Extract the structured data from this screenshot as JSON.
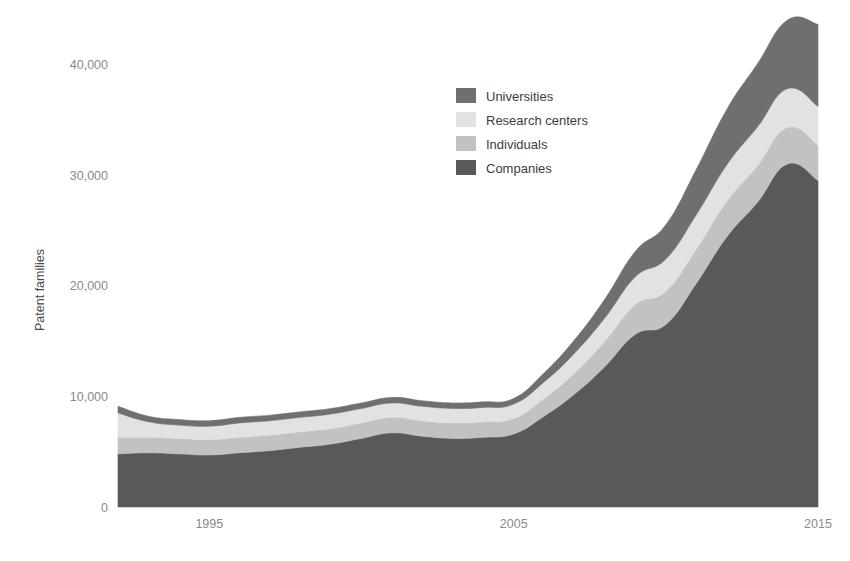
{
  "chart_data": {
    "type": "area",
    "stacked": true,
    "title": "",
    "xlabel": "",
    "ylabel": "Patent families",
    "xlim": [
      1992,
      2015
    ],
    "ylim": [
      0,
      44000
    ],
    "grid": false,
    "legend_position": "inside-upper-center",
    "y_ticks": [
      0,
      10000,
      20000,
      30000,
      40000
    ],
    "y_tick_labels": [
      "0",
      "10,000",
      "20,000",
      "30,000",
      "40,000"
    ],
    "x_ticks": [
      1995,
      2005,
      2015
    ],
    "x_tick_labels": [
      "1995",
      "2005",
      "2015"
    ],
    "x": [
      1992,
      1993,
      1994,
      1995,
      1996,
      1997,
      1998,
      1999,
      2000,
      2001,
      2002,
      2003,
      2004,
      2005,
      2006,
      2007,
      2008,
      2009,
      2010,
      2011,
      2012,
      2013,
      2014,
      2015
    ],
    "series": [
      {
        "name": "Companies",
        "color": "#595959",
        "stack_order": 1,
        "values": [
          4800,
          4900,
          4800,
          4700,
          4900,
          5100,
          5400,
          5700,
          6200,
          6700,
          6400,
          6200,
          6300,
          6600,
          8200,
          10200,
          12700,
          15600,
          16500,
          20200,
          24400,
          27500,
          31000,
          29500
        ]
      },
      {
        "name": "Individuals",
        "color": "#c2c2c2",
        "stack_order": 2,
        "values": [
          1500,
          1400,
          1400,
          1400,
          1400,
          1400,
          1400,
          1400,
          1400,
          1400,
          1400,
          1400,
          1400,
          1400,
          1600,
          1900,
          2300,
          2700,
          3000,
          3100,
          3200,
          3300,
          3300,
          3200
        ]
      },
      {
        "name": "Research centers",
        "color": "#e2e2e2",
        "stack_order": 3,
        "values": [
          2200,
          1400,
          1200,
          1200,
          1300,
          1300,
          1300,
          1300,
          1300,
          1300,
          1300,
          1300,
          1300,
          1300,
          1500,
          1800,
          2100,
          2500,
          2900,
          3100,
          3300,
          3500,
          3500,
          3500
        ]
      },
      {
        "name": "Universities",
        "color": "#6f6f6f",
        "stack_order": 4,
        "values": [
          600,
          500,
          500,
          500,
          500,
          500,
          500,
          500,
          500,
          500,
          500,
          500,
          500,
          500,
          800,
          1200,
          1700,
          2300,
          3100,
          4100,
          5000,
          5700,
          6200,
          7400
        ]
      }
    ],
    "totals": [
      9100,
      8200,
      7900,
      7800,
      8100,
      8300,
      8600,
      8900,
      9400,
      9900,
      9600,
      9400,
      9500,
      9800,
      12100,
      15100,
      18800,
      23100,
      25500,
      30500,
      35900,
      40000,
      44000,
      43600
    ]
  },
  "legend": {
    "items": [
      {
        "label": "Universities",
        "color": "#6f6f6f"
      },
      {
        "label": "Research centers",
        "color": "#e2e2e2"
      },
      {
        "label": "Individuals",
        "color": "#c2c2c2"
      },
      {
        "label": "Companies",
        "color": "#595959"
      }
    ]
  },
  "axes": {
    "y_title": "Patent families",
    "y_labels": [
      "40,000",
      "30,000",
      "20,000",
      "10,000",
      "0"
    ],
    "x_labels": [
      "1995",
      "2005",
      "2015"
    ]
  },
  "colors": {
    "background": "#ffffff",
    "tick_text": "#8a8a8a",
    "axis_title_text": "#4a4a4a",
    "legend_text": "#3d3d3d",
    "companies": "#595959",
    "individuals": "#c2c2c2",
    "research_centers": "#e2e2e2",
    "universities": "#6f6f6f"
  }
}
